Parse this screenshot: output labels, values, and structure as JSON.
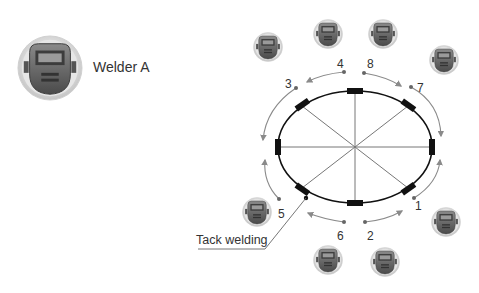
{
  "legend": {
    "icon": "welding-helmet-icon",
    "label": "Welder A"
  },
  "diagram": {
    "type": "weld-sequence-ellipse",
    "center": [
      355,
      147
    ],
    "rx": 77,
    "ry": 56,
    "spokes": 8,
    "colors": {
      "outline": "#111111",
      "spoke": "#777777",
      "arrow": "#8a8a8a",
      "tack": "#111111",
      "text": "#333333"
    },
    "sequence_labels": [
      {
        "id": "1",
        "text": "1",
        "x": 415,
        "y": 200
      },
      {
        "id": "2",
        "text": "2",
        "x": 367,
        "y": 230
      },
      {
        "id": "3",
        "text": "3",
        "x": 285,
        "y": 78
      },
      {
        "id": "4",
        "text": "4",
        "x": 337,
        "y": 58
      },
      {
        "id": "5",
        "text": "5",
        "x": 278,
        "y": 208
      },
      {
        "id": "6",
        "text": "6",
        "x": 337,
        "y": 230
      },
      {
        "id": "7",
        "text": "7",
        "x": 417,
        "y": 82
      },
      {
        "id": "8",
        "text": "8",
        "x": 367,
        "y": 58
      }
    ],
    "tack_label": {
      "text": "Tack welding",
      "x": 194,
      "y": 233
    },
    "welder_icons": [
      {
        "x": 268,
        "y": 47
      },
      {
        "x": 328,
        "y": 34
      },
      {
        "x": 383,
        "y": 34
      },
      {
        "x": 444,
        "y": 60
      },
      {
        "x": 257,
        "y": 212
      },
      {
        "x": 446,
        "y": 222
      },
      {
        "x": 328,
        "y": 260
      },
      {
        "x": 385,
        "y": 262
      }
    ]
  }
}
